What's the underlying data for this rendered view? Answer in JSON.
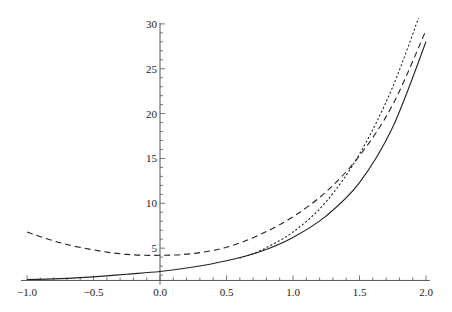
{
  "chart_data": {
    "type": "line",
    "title": "",
    "xlabel": "",
    "ylabel": "",
    "xlim": [
      -1.0,
      2.0
    ],
    "ylim": [
      1.4,
      30
    ],
    "axes_origin": [
      0,
      1.4
    ],
    "grid": false,
    "legend": null,
    "x_ticks": [
      -1.0,
      -0.5,
      0.0,
      0.5,
      1.0,
      1.5,
      2.0
    ],
    "x_tick_labels": [
      "-1.0",
      "-0.5",
      "0.0",
      "0.5",
      "1.0",
      "1.5",
      "2.0"
    ],
    "y_ticks": [
      5,
      10,
      15,
      20,
      25,
      30
    ],
    "y_tick_labels": [
      "5",
      "10",
      "15",
      "20",
      "25",
      "30"
    ],
    "series": [
      {
        "name": "solid",
        "style": "solid",
        "x": [
          -1.0,
          -0.75,
          -0.5,
          -0.25,
          0.0,
          0.25,
          0.5,
          0.75,
          1.0,
          1.25,
          1.5,
          1.75,
          2.0
        ],
        "y": [
          1.5,
          1.6,
          1.8,
          2.1,
          2.4,
          2.9,
          3.6,
          4.6,
          6.2,
          8.6,
          12.3,
          18.5,
          28.0
        ]
      },
      {
        "name": "dashed",
        "style": "dashed",
        "x": [
          -1.0,
          -0.75,
          -0.5,
          -0.25,
          0.0,
          0.25,
          0.5,
          0.75,
          1.0,
          1.25,
          1.5,
          1.75,
          2.0
        ],
        "y": [
          6.8,
          5.6,
          4.8,
          4.3,
          4.2,
          4.4,
          5.1,
          6.5,
          8.5,
          11.3,
          15.3,
          21.0,
          29.3
        ]
      },
      {
        "name": "dotted",
        "style": "dotted",
        "x": [
          0.6,
          0.75,
          1.0,
          1.25,
          1.5,
          1.75,
          2.0
        ],
        "y": [
          3.9,
          4.7,
          6.8,
          10.2,
          15.5,
          23.0,
          33.0
        ]
      }
    ]
  }
}
